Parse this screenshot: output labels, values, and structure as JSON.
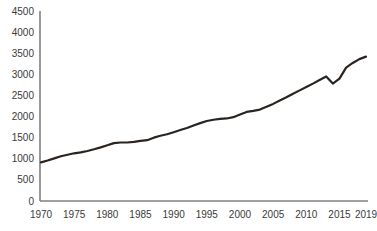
{
  "chart_data": {
    "type": "line",
    "title": "",
    "subtitle": "",
    "xlabel": "",
    "ylabel": "",
    "xlim": [
      1970,
      2019
    ],
    "ylim": [
      0,
      4500
    ],
    "grid": false,
    "legend": null,
    "legend_position": "none",
    "series_color": "#2a2420",
    "axis_color": "#808080",
    "yticks": [
      0,
      500,
      1000,
      1500,
      2000,
      2500,
      3000,
      3500,
      4000,
      4500
    ],
    "ytick_labels": [
      "0",
      "500",
      "1000",
      "1500",
      "2000",
      "2500",
      "3000",
      "3500",
      "4000",
      "4500"
    ],
    "xticks": [
      1970,
      1975,
      1980,
      1985,
      1990,
      1995,
      2000,
      2005,
      2010,
      2015,
      2019
    ],
    "xtick_labels": [
      "1970",
      "1975",
      "1980",
      "1985",
      "1990",
      "1995",
      "2000",
      "2005",
      "2010",
      "2015",
      "2019"
    ],
    "x": [
      1970,
      1971,
      1972,
      1973,
      1974,
      1975,
      1976,
      1977,
      1978,
      1979,
      1980,
      1981,
      1982,
      1983,
      1984,
      1985,
      1986,
      1987,
      1988,
      1989,
      1990,
      1991,
      1992,
      1993,
      1994,
      1995,
      1996,
      1997,
      1998,
      1999,
      2000,
      2001,
      2002,
      2003,
      2004,
      2005,
      2006,
      2007,
      2008,
      2009,
      2010,
      2011,
      2012,
      2013,
      2014,
      2015,
      2016,
      2017,
      2018,
      2019
    ],
    "values": [
      915,
      960,
      1010,
      1060,
      1095,
      1130,
      1150,
      1185,
      1225,
      1270,
      1320,
      1370,
      1385,
      1385,
      1400,
      1425,
      1440,
      1500,
      1545,
      1580,
      1630,
      1680,
      1730,
      1790,
      1845,
      1895,
      1925,
      1945,
      1955,
      1985,
      2050,
      2110,
      2135,
      2165,
      2230,
      2300,
      2380,
      2455,
      2540,
      2620,
      2700,
      2780,
      2865,
      2950,
      2780,
      2900,
      3160,
      3270,
      3360,
      3420
    ]
  }
}
